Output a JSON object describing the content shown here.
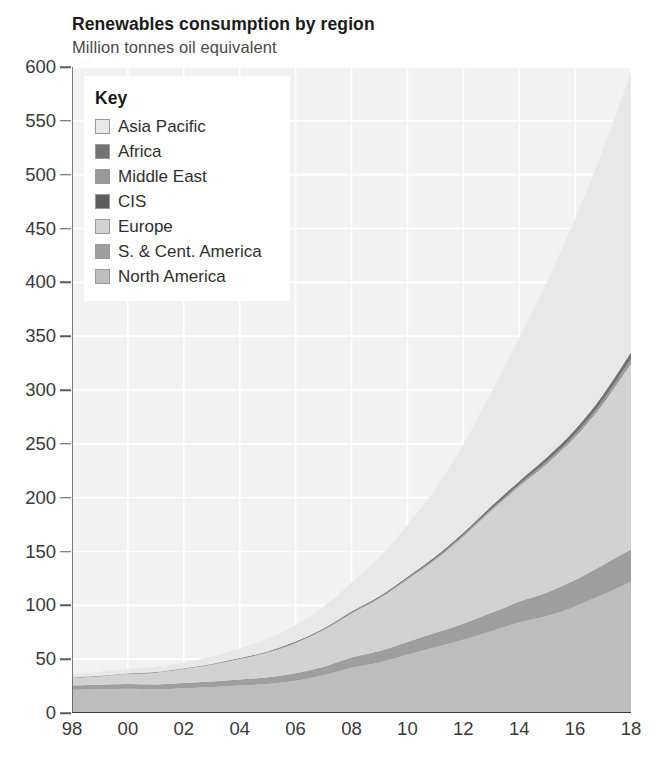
{
  "header": {
    "title": "Renewables consumption by region",
    "subtitle": "Million tonnes oil equivalent"
  },
  "legend": {
    "title": "Key",
    "items": [
      {
        "label": "Asia Pacific",
        "color": "#e8e8e8"
      },
      {
        "label": "Africa",
        "color": "#737373"
      },
      {
        "label": "Middle East",
        "color": "#9a9a9a"
      },
      {
        "label": "CIS",
        "color": "#5d5d5d"
      },
      {
        "label": "Europe",
        "color": "#d2d2d2"
      },
      {
        "label": "S. & Cent. America",
        "color": "#9e9e9e"
      },
      {
        "label": "North America",
        "color": "#bdbdbd"
      }
    ]
  },
  "axes": {
    "y_ticks": [
      "600",
      "550",
      "500",
      "450",
      "400",
      "350",
      "300",
      "250",
      "200",
      "150",
      "100",
      "50",
      "0"
    ],
    "x_ticks": [
      "98",
      "00",
      "02",
      "04",
      "06",
      "08",
      "10",
      "12",
      "14",
      "16",
      "18"
    ]
  },
  "chart_data": {
    "type": "area",
    "stacked": true,
    "title": "Renewables consumption by region",
    "subtitle": "Million tonnes oil equivalent",
    "xlabel": "",
    "ylabel": "Million tonnes oil equivalent",
    "ylim": [
      0,
      600
    ],
    "xlim": [
      1998,
      2018
    ],
    "grid": true,
    "legend_position": "top-left-inside",
    "legend_title": "Key",
    "x": [
      1998,
      1999,
      2000,
      2001,
      2002,
      2003,
      2004,
      2005,
      2006,
      2007,
      2008,
      2009,
      2010,
      2011,
      2012,
      2013,
      2014,
      2015,
      2016,
      2017,
      2018
    ],
    "x_tick_labels": [
      "98",
      "",
      "00",
      "",
      "02",
      "",
      "04",
      "",
      "06",
      "",
      "08",
      "",
      "10",
      "",
      "12",
      "",
      "14",
      "",
      "16",
      "",
      "18"
    ],
    "series": [
      {
        "name": "North America",
        "color": "#bdbdbd",
        "values": [
          21.5,
          22.0,
          22.5,
          22.0,
          23.0,
          24.0,
          25.5,
          27.0,
          30.0,
          35.0,
          42.0,
          47.0,
          54.0,
          61.0,
          68.0,
          76.0,
          84.0,
          90.0,
          99.0,
          110.0,
          122.0
        ]
      },
      {
        "name": "S. & Cent. America",
        "color": "#9e9e9e",
        "values": [
          4.0,
          4.2,
          4.4,
          4.5,
          4.8,
          5.2,
          5.6,
          6.2,
          7.0,
          8.0,
          9.5,
          10.5,
          12.0,
          13.5,
          15.0,
          17.0,
          19.5,
          22.0,
          24.5,
          27.5,
          30.0
        ]
      },
      {
        "name": "Europe",
        "color": "#d2d2d2",
        "values": [
          7.0,
          8.0,
          9.5,
          11.0,
          13.0,
          15.5,
          19.0,
          23.0,
          28.0,
          34.0,
          41.0,
          49.0,
          58.0,
          68.0,
          81.0,
          95.0,
          107.0,
          120.0,
          133.0,
          150.0,
          173.0
        ]
      },
      {
        "name": "CIS",
        "color": "#5d5d5d",
        "values": [
          0.1,
          0.1,
          0.1,
          0.1,
          0.1,
          0.1,
          0.1,
          0.1,
          0.2,
          0.2,
          0.2,
          0.2,
          0.3,
          0.3,
          0.4,
          0.4,
          0.5,
          0.6,
          0.7,
          0.9,
          1.2
        ]
      },
      {
        "name": "Middle East",
        "color": "#9a9a9a",
        "values": [
          0.1,
          0.1,
          0.1,
          0.1,
          0.1,
          0.2,
          0.2,
          0.2,
          0.3,
          0.3,
          0.4,
          0.5,
          0.6,
          0.7,
          0.9,
          1.0,
          1.2,
          1.4,
          1.7,
          2.1,
          2.6
        ]
      },
      {
        "name": "Africa",
        "color": "#737373",
        "values": [
          0.3,
          0.3,
          0.4,
          0.4,
          0.5,
          0.5,
          0.6,
          0.7,
          0.8,
          0.9,
          1.1,
          1.3,
          1.5,
          1.8,
          2.2,
          2.6,
          3.1,
          3.7,
          4.4,
          5.2,
          6.2
        ]
      },
      {
        "name": "Asia Pacific",
        "color": "#e8e8e8",
        "values": [
          3.0,
          3.5,
          4.0,
          4.8,
          5.6,
          7.0,
          9.0,
          11.5,
          15.0,
          20.0,
          27.0,
          36.0,
          48.0,
          63.0,
          82.0,
          106.0,
          133.0,
          163.0,
          196.0,
          228.0,
          260.0
        ]
      }
    ],
    "totals": [
      36.0,
      38.2,
      41.0,
      42.9,
      47.1,
      52.5,
      60.0,
      68.7,
      81.3,
      98.4,
      121.2,
      144.5,
      174.4,
      208.3,
      249.5,
      298.0,
      348.3,
      401.7,
      459.3,
      523.7,
      595.0
    ]
  }
}
